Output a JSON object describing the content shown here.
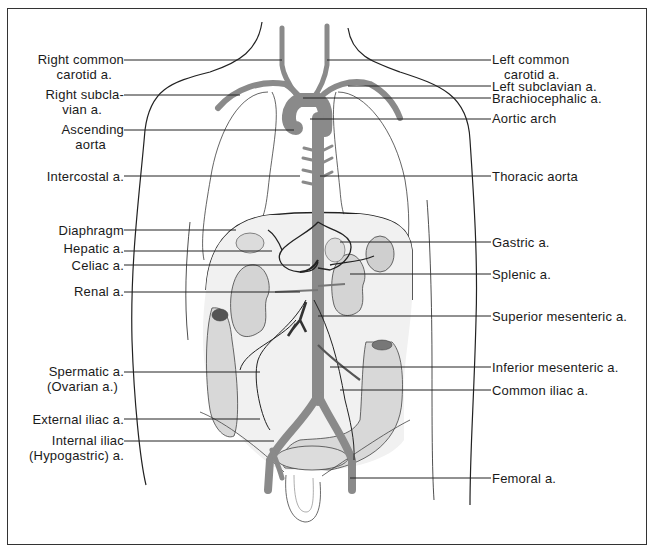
{
  "diagram": {
    "colors": {
      "artery": "#8a8a8a",
      "outline": "#222222",
      "organ_fill": "#e4e4e4",
      "organ_shade": "#c8c8c8",
      "leader_line": "#222222",
      "frame": "#333333"
    },
    "labels_left": [
      {
        "id": "right-common-carotid",
        "lines": [
          "Right common",
          "carotid a."
        ]
      },
      {
        "id": "right-subclavian",
        "lines": [
          "Right subcla-",
          "vian a."
        ]
      },
      {
        "id": "ascending-aorta",
        "lines": [
          "Ascending",
          "aorta"
        ]
      },
      {
        "id": "intercostal",
        "lines": [
          "Intercostal a."
        ]
      },
      {
        "id": "diaphragm",
        "lines": [
          "Diaphragm"
        ]
      },
      {
        "id": "hepatic",
        "lines": [
          "Hepatic a."
        ]
      },
      {
        "id": "celiac",
        "lines": [
          "Celiac a."
        ]
      },
      {
        "id": "renal",
        "lines": [
          "Renal a."
        ]
      },
      {
        "id": "spermatic",
        "lines": [
          "Spermatic a.",
          "(Ovarian a.)"
        ]
      },
      {
        "id": "external-iliac",
        "lines": [
          "External iliac a."
        ]
      },
      {
        "id": "internal-iliac",
        "lines": [
          "Internal iliac",
          "(Hypogastric) a."
        ]
      }
    ],
    "labels_right": [
      {
        "id": "left-common-carotid",
        "lines": [
          "Left common",
          "carotid a."
        ]
      },
      {
        "id": "left-subclavian",
        "lines": [
          "Left subclavian a."
        ]
      },
      {
        "id": "brachiocephalic",
        "lines": [
          "Brachiocephalic a."
        ]
      },
      {
        "id": "aortic-arch",
        "lines": [
          "Aortic arch"
        ]
      },
      {
        "id": "thoracic-aorta",
        "lines": [
          "Thoracic aorta"
        ]
      },
      {
        "id": "gastric",
        "lines": [
          "Gastric a."
        ]
      },
      {
        "id": "splenic",
        "lines": [
          "Splenic a."
        ]
      },
      {
        "id": "superior-mesenteric",
        "lines": [
          "Superior mesenteric a."
        ]
      },
      {
        "id": "inferior-mesenteric",
        "lines": [
          "Inferior mesenteric a."
        ]
      },
      {
        "id": "common-iliac",
        "lines": [
          "Common iliac a."
        ]
      },
      {
        "id": "femoral",
        "lines": [
          "Femoral a."
        ]
      }
    ]
  }
}
